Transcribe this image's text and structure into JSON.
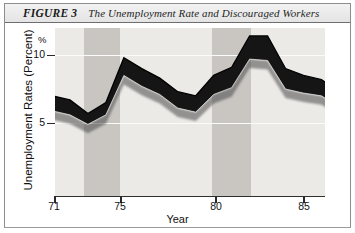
{
  "figure": {
    "label": "FIGURE 3",
    "title": "The Unemployment Rate and Discouraged Workers"
  },
  "axes": {
    "y_title": "Unemployment Rates (Percent)",
    "y_unit": "%",
    "y_ticks": [
      "10",
      "5"
    ],
    "x_title": "Year",
    "x_ticks": [
      "71",
      "75",
      "80",
      "85"
    ]
  },
  "chart_data": {
    "type": "area",
    "title": "The Unemployment Rate and Discouraged Workers",
    "xlabel": "Year",
    "ylabel": "Unemployment Rates (Percent)",
    "xlim": [
      1971,
      1987
    ],
    "ylim": [
      0,
      12
    ],
    "yticks": [
      5,
      10
    ],
    "xticks": [
      71,
      75,
      80,
      85
    ],
    "grid": true,
    "legend": "none",
    "band_fill": "#141414",
    "plot_background": "#eceae7",
    "recession_shading_color": "#c9c6c2",
    "recession_bands": [
      {
        "start": 1972.8,
        "end": 1974.8
      },
      {
        "start": 1979.9,
        "end": 1982.1
      }
    ],
    "x": [
      1971,
      1972,
      1973,
      1974,
      1975,
      1976,
      1977,
      1978,
      1979,
      1980,
      1981,
      1982,
      1983,
      1984,
      1985,
      1986,
      1987
    ],
    "series": [
      {
        "name": "Unemployment rate plus discouraged workers",
        "values": [
          7.0,
          6.7,
          5.7,
          6.5,
          9.8,
          9.0,
          8.3,
          7.3,
          7.0,
          8.5,
          9.1,
          11.4,
          11.4,
          9.0,
          8.5,
          8.2,
          7.2
        ]
      },
      {
        "name": "Unemployment rate",
        "values": [
          5.9,
          5.6,
          4.9,
          5.6,
          8.5,
          7.7,
          7.1,
          6.1,
          5.8,
          7.1,
          7.6,
          9.7,
          9.6,
          7.5,
          7.2,
          7.0,
          6.2
        ]
      }
    ]
  }
}
